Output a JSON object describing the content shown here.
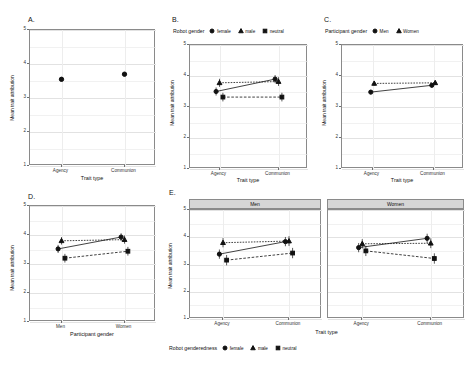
{
  "figure": {
    "y_axis_label": "Mean trait attribution",
    "x_axis_label_trait": "Trait type",
    "x_axis_label_participant": "Participant gender",
    "y_ticks": [
      "1",
      "2",
      "3",
      "4",
      "5"
    ],
    "trait_levels": [
      "Agency",
      "Communion"
    ],
    "participant_levels": [
      "Men",
      "Women"
    ],
    "accent_color": "#111111",
    "strip_color": "#d6d6d6"
  },
  "panels": {
    "a": {
      "letter": "A."
    },
    "b": {
      "letter": "B.",
      "legend_title": "Robot gender",
      "legend": [
        "female",
        "male",
        "neutral"
      ]
    },
    "c": {
      "letter": "C.",
      "legend_title": "Participant gender",
      "legend": [
        "Men",
        "Women"
      ]
    },
    "d": {
      "letter": "D."
    },
    "e": {
      "letter": "E.",
      "facets": [
        "Men",
        "Women"
      ],
      "legend_title": "Robot genderedness",
      "legend": [
        "female",
        "male",
        "neutral"
      ]
    }
  },
  "chart_data": [
    {
      "type": "scatter",
      "panel": "A",
      "title": "",
      "xlabel": "Trait type",
      "ylabel": "Mean trait attribution",
      "categories": [
        "Agency",
        "Communion"
      ],
      "ylim": [
        1,
        5
      ],
      "grid": true,
      "legend": "none",
      "series": [
        {
          "name": "overall",
          "marker": "circle",
          "line": "none",
          "values": [
            3.55,
            3.7
          ],
          "errors": [
            0.05,
            0.05
          ]
        }
      ]
    },
    {
      "type": "scatter",
      "panel": "B",
      "title": "",
      "xlabel": "Trait type",
      "ylabel": "Mean trait attribution",
      "categories": [
        "Agency",
        "Communion"
      ],
      "ylim": [
        1,
        5
      ],
      "grid": true,
      "legend": "top",
      "legend_title": "Robot gender",
      "series": [
        {
          "name": "female",
          "marker": "circle",
          "line": "solid",
          "values": [
            3.5,
            3.9
          ],
          "errors": [
            0.13,
            0.13
          ]
        },
        {
          "name": "male",
          "marker": "triangle",
          "line": "dotted",
          "values": [
            3.78,
            3.82
          ],
          "errors": [
            0.13,
            0.14
          ]
        },
        {
          "name": "neutral",
          "marker": "square",
          "line": "dashed",
          "values": [
            3.32,
            3.32
          ],
          "errors": [
            0.14,
            0.14
          ]
        }
      ]
    },
    {
      "type": "scatter",
      "panel": "C",
      "title": "",
      "xlabel": "Trait type",
      "ylabel": "Mean trait attribution",
      "categories": [
        "Agency",
        "Communion"
      ],
      "ylim": [
        1,
        5
      ],
      "grid": true,
      "legend": "top",
      "legend_title": "Participant gender",
      "series": [
        {
          "name": "Men",
          "marker": "circle",
          "line": "solid",
          "values": [
            3.48,
            3.7
          ],
          "errors": [
            0.07,
            0.07
          ]
        },
        {
          "name": "Women",
          "marker": "triangle",
          "line": "dotted",
          "values": [
            3.76,
            3.78
          ],
          "errors": [
            0.07,
            0.07
          ]
        }
      ]
    },
    {
      "type": "scatter",
      "panel": "D",
      "title": "",
      "xlabel": "Participant gender",
      "ylabel": "Mean trait attribution",
      "categories": [
        "Men",
        "Women"
      ],
      "ylim": [
        1,
        5
      ],
      "grid": true,
      "legend": "none",
      "series": [
        {
          "name": "female",
          "marker": "circle",
          "line": "solid",
          "values": [
            3.52,
            3.93
          ],
          "errors": [
            0.14,
            0.13
          ]
        },
        {
          "name": "male",
          "marker": "triangle",
          "line": "dotted",
          "values": [
            3.8,
            3.84
          ],
          "errors": [
            0.13,
            0.14
          ]
        },
        {
          "name": "neutral",
          "marker": "square",
          "line": "dashed",
          "values": [
            3.2,
            3.44
          ],
          "errors": [
            0.15,
            0.15
          ]
        }
      ]
    },
    {
      "type": "scatter",
      "panel": "E",
      "title": "",
      "xlabel": "Trait type",
      "ylabel": "Mean trait attribution",
      "categories": [
        "Agency",
        "Communion"
      ],
      "ylim": [
        1,
        5
      ],
      "grid": true,
      "legend": "bottom",
      "legend_title": "Robot genderedness",
      "facets": [
        {
          "name": "Men",
          "series": [
            {
              "name": "female",
              "marker": "circle",
              "line": "solid",
              "values": [
                3.38,
                3.84
              ],
              "errors": [
                0.17,
                0.17
              ]
            },
            {
              "name": "male",
              "marker": "triangle",
              "line": "dotted",
              "values": [
                3.8,
                3.86
              ],
              "errors": [
                0.17,
                0.18
              ]
            },
            {
              "name": "neutral",
              "marker": "square",
              "line": "dashed",
              "values": [
                3.16,
                3.42
              ],
              "errors": [
                0.19,
                0.19
              ]
            }
          ]
        },
        {
          "name": "Women",
          "series": [
            {
              "name": "female",
              "marker": "circle",
              "line": "solid",
              "values": [
                3.62,
                3.96
              ],
              "errors": [
                0.17,
                0.17
              ]
            },
            {
              "name": "male",
              "marker": "triangle",
              "line": "dotted",
              "values": [
                3.76,
                3.78
              ],
              "errors": [
                0.17,
                0.18
              ]
            },
            {
              "name": "neutral",
              "marker": "square",
              "line": "dashed",
              "values": [
                3.5,
                3.22
              ],
              "errors": [
                0.19,
                0.19
              ]
            }
          ]
        }
      ]
    }
  ]
}
